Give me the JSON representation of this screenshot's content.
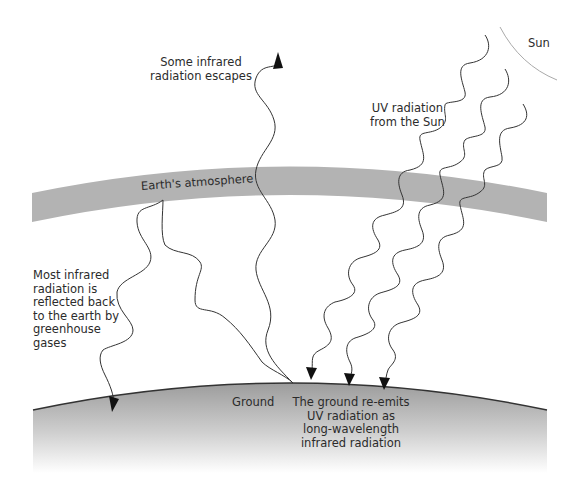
{
  "diagram": {
    "labels": {
      "sun": "Sun",
      "escapes": "Some infrared\nradiation escapes",
      "uv": "UV radiation\nfrom the Sun",
      "atmosphere": "Earth's atmosphere",
      "reflected": "Most infrared\nradiation is\nreflected back\nto the earth by\ngreenhouse\ngases",
      "ground": "Ground",
      "reemits": "The ground re-emits\nUV radiation as\nlong-wavelength\ninfrared radiation"
    },
    "colors": {
      "atmosphere": "#b3b3b3",
      "ground_top": "#9e9e9e",
      "ground_bottom": "#ffffff",
      "line": "#333333",
      "sun_arc": "#aaaaaa"
    }
  }
}
